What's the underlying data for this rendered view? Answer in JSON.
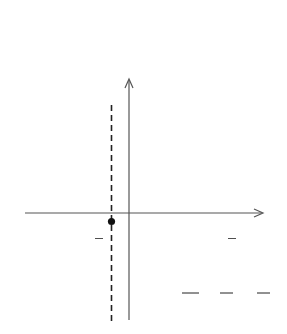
{
  "chart_data": {
    "type": "line",
    "title": "",
    "function": "f(x) = x^2/8 + x/4 - 3/8",
    "xlabel": "x",
    "ylabel": "y",
    "xlim": [
      -6,
      6
    ],
    "ylim": [
      -6,
      6
    ],
    "grid": true,
    "grid_step": 1,
    "series": [
      {
        "name": "f(x)",
        "x": [
          -6,
          -5,
          -4,
          -3,
          -2,
          -1,
          0,
          1,
          2,
          3,
          4,
          5,
          6
        ],
        "values": [
          2.625,
          1.25,
          0.625,
          0,
          -0.375,
          -0.5,
          -0.375,
          0,
          0.625,
          1.25,
          2.625,
          3.75,
          5.625
        ]
      }
    ],
    "annotations": [
      {
        "type": "vertical-dashed-line",
        "x": -1,
        "label": "x = −1"
      },
      {
        "type": "point",
        "x": -1,
        "y": -0.5,
        "label": "(−1, −1/2)"
      },
      {
        "type": "text",
        "label": "Minimum: −1/2"
      },
      {
        "type": "equation",
        "label": "f(x) = x²/8 + x/4 − 3/8"
      }
    ]
  },
  "labels": {
    "y_axis": "y",
    "x_axis": "x",
    "dashed_line": "x = −1",
    "vertex_open": "(−1, −",
    "vertex_num": "1",
    "vertex_den": "2",
    "vertex_close": ")",
    "minimum_text": "Minimum: −",
    "minimum_num": "1",
    "minimum_den": "2",
    "eq_lhs": "f(x) =",
    "eq_t1_num": "x",
    "eq_t1_exp": "2",
    "eq_t1_den": "8",
    "eq_plus": "+",
    "eq_t2_num": "x",
    "eq_t2_den": "4",
    "eq_minus": "−",
    "eq_t3_num": "3",
    "eq_t3_den": "8"
  }
}
